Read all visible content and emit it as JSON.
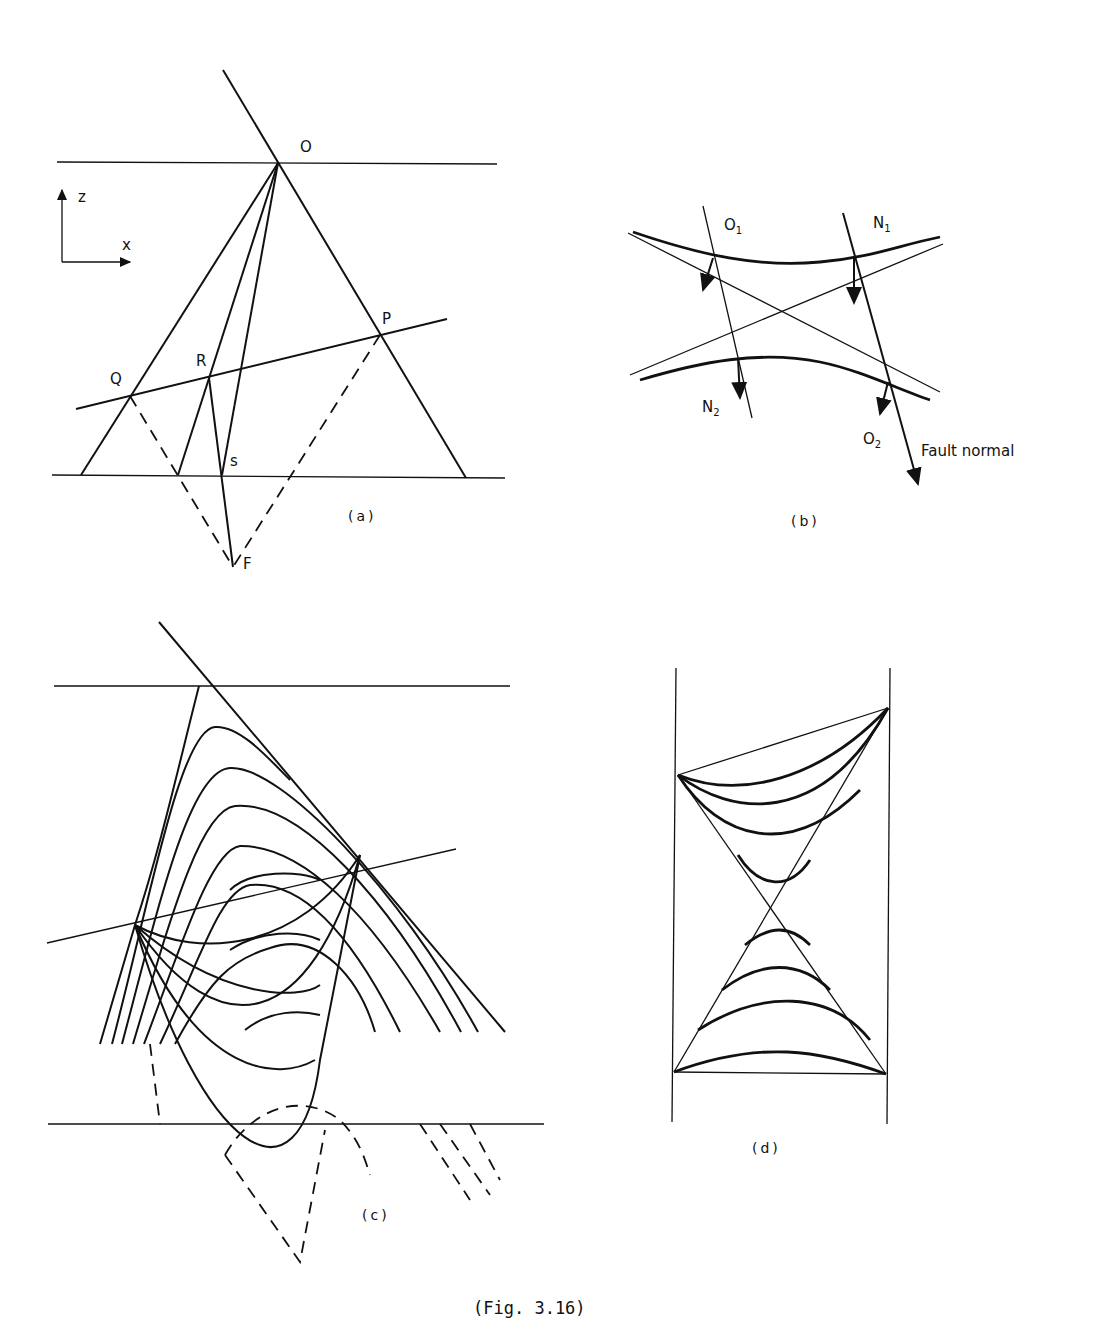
{
  "figure": {
    "caption": "(Fig. 3.16)"
  },
  "panel_a": {
    "caption": "(a)",
    "axes": {
      "z": "z",
      "x": "x"
    },
    "points": {
      "O": "O",
      "P": "P",
      "Q": "Q",
      "R": "R",
      "s": "s",
      "F": "F"
    }
  },
  "panel_b": {
    "caption": "(b)",
    "labels": {
      "O1": "O",
      "O1_sub": "1",
      "N1": "N",
      "N1_sub": "1",
      "N2": "N",
      "N2_sub": "2",
      "O2": "O",
      "O2_sub": "2",
      "fault_normal": "Fault normal"
    }
  },
  "panel_c": {
    "caption": "(c)"
  },
  "panel_d": {
    "caption": "(d)"
  }
}
